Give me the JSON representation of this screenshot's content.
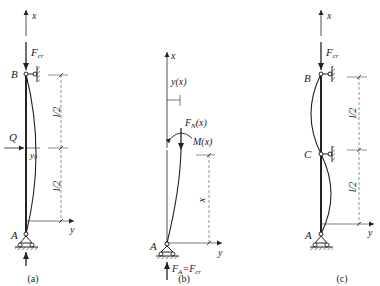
{
  "figures": {
    "a": {
      "caption": "(a)",
      "axis_x": "x",
      "axis_y": "y",
      "load_label": "F",
      "load_sub": "cr",
      "top_point": "B",
      "bottom_point": "A",
      "lateral_load": "Q",
      "deflection": "y",
      "deflection_sub": "0",
      "dim_upper": "l/2",
      "dim_lower": "l/2"
    },
    "b": {
      "caption": "(b)",
      "axis_x": "x",
      "axis_y": "y",
      "deflection_label": "y(x)",
      "normal_force": "F",
      "normal_force_sub": "N",
      "normal_force_arg": "(x)",
      "moment": "M(x)",
      "dim_label": "x",
      "bottom_point": "A",
      "reaction_lhs": "F",
      "reaction_lhs_sub": "A",
      "reaction_eq": "=F",
      "reaction_rhs_sub": "cr"
    },
    "c": {
      "caption": "(c)",
      "axis_x": "x",
      "axis_y": "y",
      "load_label": "F",
      "load_sub": "cr",
      "top_point": "B",
      "mid_point": "C",
      "bottom_point": "A",
      "dim_upper": "l/2",
      "dim_lower": "l/2"
    }
  }
}
